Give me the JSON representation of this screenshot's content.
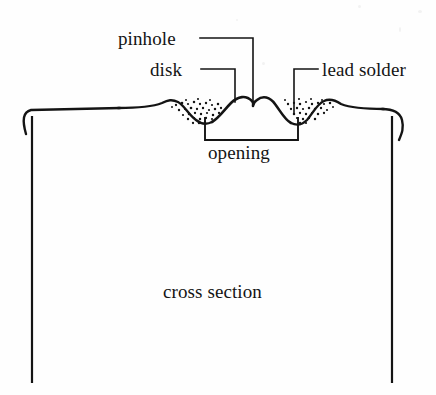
{
  "figure": {
    "background_color": "#fefefe",
    "ink_color": "#141414",
    "labels": {
      "pinhole": "pinhole",
      "disk": "disk",
      "lead_solder": "lead solder",
      "opening": "opening",
      "cross_section": "cross section"
    },
    "annotations": [
      {
        "name": "pinhole",
        "text": "pinhole",
        "leader": "horizontal from text right edge, then elbow down to dome notch",
        "target": "notch at right shoulder of central dome"
      },
      {
        "name": "disk",
        "text": "disk",
        "leader": "horizontal from text right edge, then elbow down to dome crest",
        "target": "crest of central dome"
      },
      {
        "name": "lead solder",
        "text": "lead solder",
        "leader": "horizontal from text left edge, then elbow down into stippled valley",
        "target": "stippled solder fillet right of central dome"
      },
      {
        "name": "opening",
        "text": "opening",
        "leader": "rectangular bracket beneath the central dome",
        "target": "opening span under dome"
      },
      {
        "name": "cross section",
        "text": "cross section",
        "leader": "none",
        "target": "interior of vessel body"
      }
    ],
    "geometry": {
      "profile": "wavy horizontal lid profile with two small outer bumps, two stippled solder valleys and one tall central dome",
      "left_wall_x": 32,
      "right_wall_x": 392,
      "wall_bottom_y": 383,
      "rim_curl": "both ends of the lid curl downward into a hooked rim",
      "dome_center_x": 252,
      "dome_apex_y": 98,
      "opening_bracket": {
        "left_x": 205,
        "right_x": 298,
        "top_y": 118,
        "bottom_y": 140
      }
    },
    "stipple": {
      "description": "ink stipple dots representing lead solder fillets",
      "regions": [
        "valley left of dome",
        "valley right of dome"
      ],
      "dot_color": "#141414"
    }
  }
}
